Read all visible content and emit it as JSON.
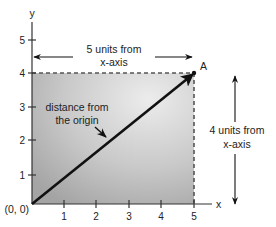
{
  "diagram": {
    "axes": {
      "x_label": "x",
      "y_label": "y",
      "origin_label": "(0, 0)",
      "x_ticks": [
        "1",
        "2",
        "3",
        "4",
        "5"
      ],
      "y_ticks": [
        "1",
        "2",
        "3",
        "4",
        "5"
      ]
    },
    "point": {
      "label": "A",
      "x": 5,
      "y": 4
    },
    "annotations": {
      "horizontal_distance_line1": "5 units from",
      "horizontal_distance_line2": "x-axis",
      "vertical_distance_line1": "4 units from",
      "vertical_distance_line2": "x-axis",
      "vector_line1": "distance from",
      "vector_line2": "the origin"
    },
    "colors": {
      "shade_light": "#e6e6e6",
      "shade_dark": "#a9a9a9",
      "ink": "#111111",
      "dash": "#555555"
    }
  }
}
